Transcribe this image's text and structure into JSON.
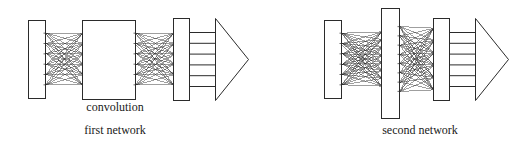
{
  "figure": {
    "type": "diagram",
    "background_color": "#ffffff",
    "stroke_color": "#2b2b2b",
    "fill_color": "#ffffff"
  },
  "labels": {
    "convolution": "convolution",
    "first_network": "first network",
    "second_network": "second network"
  },
  "networks": [
    {
      "id": "first-network",
      "caption": "first network",
      "inner_label": "convolution",
      "layers": [
        {
          "name": "input-layer",
          "shape": "rect",
          "x": 28,
          "y": 20,
          "width": 17,
          "height": 78,
          "nodes": 6
        },
        {
          "name": "connection-bundle-1",
          "shape": "mesh",
          "x": 45,
          "y": 28,
          "width": 37,
          "height": 62,
          "left_nodes": 6,
          "right_nodes": 6
        },
        {
          "name": "convolution-layer",
          "shape": "rect",
          "x": 82,
          "y": 20,
          "width": 53,
          "height": 79,
          "label": "convolution"
        },
        {
          "name": "connection-bundle-2",
          "shape": "mesh",
          "x": 135,
          "y": 28,
          "width": 38,
          "height": 62,
          "left_nodes": 6,
          "right_nodes": 6
        },
        {
          "name": "output-layer",
          "shape": "rect",
          "x": 173,
          "y": 18,
          "width": 16,
          "height": 82,
          "nodes": 6
        },
        {
          "name": "output-cells",
          "shape": "grid",
          "x": 189,
          "y": 32,
          "width": 26,
          "height": 54,
          "cells": 5
        },
        {
          "name": "output-arrow",
          "shape": "triangle",
          "x": 215,
          "y": 18,
          "width": 33,
          "height": 82
        }
      ]
    },
    {
      "id": "second-network",
      "caption": "second network",
      "inner_label": "",
      "layers": [
        {
          "name": "input-layer",
          "shape": "rect",
          "x": 324,
          "y": 20,
          "width": 17,
          "height": 78,
          "nodes": 6
        },
        {
          "name": "connection-bundle-1",
          "shape": "mesh",
          "x": 341,
          "y": 28,
          "width": 40,
          "height": 62,
          "left_nodes": 6,
          "right_nodes": 8
        },
        {
          "name": "hidden-layer",
          "shape": "rect",
          "x": 381,
          "y": 8,
          "width": 18,
          "height": 110,
          "nodes": 8
        },
        {
          "name": "connection-bundle-2",
          "shape": "mesh",
          "x": 399,
          "y": 22,
          "width": 34,
          "height": 74,
          "left_nodes": 8,
          "right_nodes": 6
        },
        {
          "name": "output-layer",
          "shape": "rect",
          "x": 433,
          "y": 18,
          "width": 16,
          "height": 82,
          "nodes": 6
        },
        {
          "name": "output-cells",
          "shape": "grid",
          "x": 449,
          "y": 32,
          "width": 26,
          "height": 54,
          "cells": 5
        },
        {
          "name": "output-arrow",
          "shape": "triangle",
          "x": 475,
          "y": 18,
          "width": 33,
          "height": 82
        }
      ]
    }
  ]
}
